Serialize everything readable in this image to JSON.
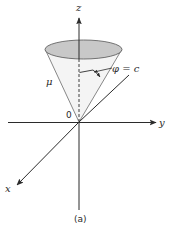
{
  "figure": {
    "caption": "(a)",
    "colors": {
      "axis": "#2b2b2b",
      "cone_edge": "#6a6a6a",
      "cone_top_fill": "#c8c8c8",
      "cone_body_fill": "#f4f4f4",
      "text": "#2a2a2a"
    },
    "axes": {
      "z_label": "z",
      "y_label": "y",
      "x_label": "x",
      "origin_label": "0"
    },
    "cone": {
      "surface_label": "μ",
      "angle_label": "φ = c"
    }
  }
}
